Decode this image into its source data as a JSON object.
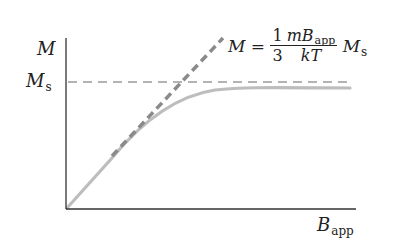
{
  "diagram": {
    "y_axis_label": "M",
    "x_axis_label": {
      "main": "B",
      "sub": "app"
    },
    "saturation_label": {
      "main": "M",
      "sub": "s"
    },
    "equation": {
      "lhs": "M",
      "equals": "=",
      "coef_num": "1",
      "coef_den": "3",
      "frac_num_main": "mB",
      "frac_num_sub": "app",
      "frac_den": "kT",
      "rhs_main": "M",
      "rhs_sub": "s"
    },
    "colors": {
      "axis": "#333333",
      "saturation_dash": "#999999",
      "tangent_dash": "#888888",
      "curve": "#bbbbbb"
    }
  }
}
